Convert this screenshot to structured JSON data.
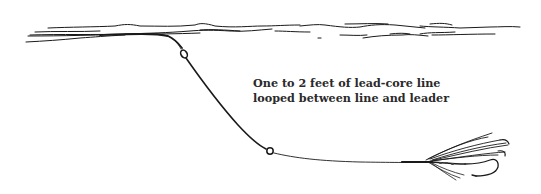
{
  "figure": {
    "caption_lines": [
      "One to 2 feet of lead-core line",
      "looped between line and leader"
    ],
    "elements": {
      "water_surface": "water-surface-strokes",
      "fly_line": "fly-line",
      "upper_loop": "loop-knot-line-to-leadcore",
      "lead_core_section": "lead-core-line",
      "lower_loop": "loop-knot-leadcore-to-leader",
      "leader": "leader",
      "fly": "wet-fly"
    },
    "colors": {
      "ink": "#1a1a1a",
      "background": "#ffffff"
    }
  }
}
